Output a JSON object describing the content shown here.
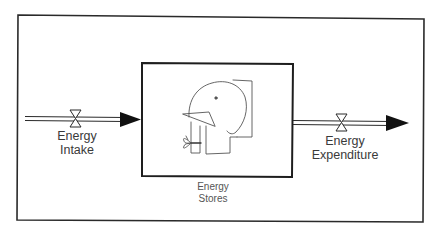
{
  "diagram": {
    "type": "stock-and-flow",
    "colors": {
      "line": "#2a2a2a",
      "background": "#ffffff",
      "text": "#3a3a3a"
    },
    "stock": {
      "name": "Energy Stores",
      "line1": "Energy",
      "line2": "Stores",
      "illustration": "elephant-icon"
    },
    "inflow": {
      "name": "Energy Intake",
      "line1": "Energy",
      "line2": "Intake",
      "valve": "valve-icon"
    },
    "outflow": {
      "name": "Energy Expenditure",
      "line1": "Energy",
      "line2": "Expenditure",
      "valve": "valve-icon"
    }
  }
}
